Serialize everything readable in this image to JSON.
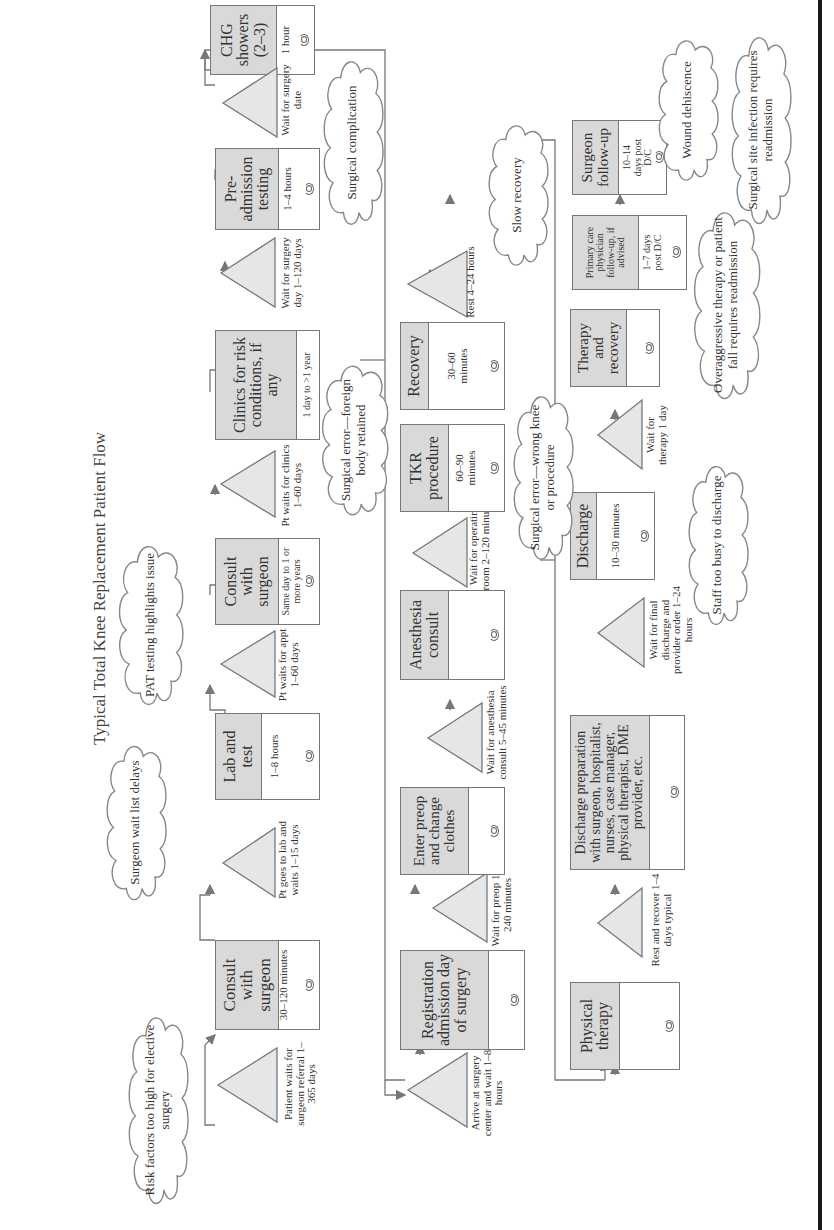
{
  "title": "Typical Total Knee Replacement Patient Flow",
  "colors": {
    "box_header": "#d9d9d9",
    "line": "#777777",
    "border": "#1a1a1a"
  },
  "process_boxes": [
    {
      "id": "consult1",
      "title": "Consult with surgeon",
      "detail": "30–120 minutes",
      "icon": "cycle-icon"
    },
    {
      "id": "lab",
      "title": "Lab and test",
      "detail": "1–8 hours",
      "icon": "cycle-icon"
    },
    {
      "id": "consult2",
      "title": "Consult with surgeon",
      "detail": "Same day to 1 or more years",
      "icon": "cycle-icon"
    },
    {
      "id": "clinics",
      "title": "Clinics for risk conditions, if any",
      "detail": "1 day to >1 year",
      "icon": ""
    },
    {
      "id": "preadmission",
      "title": "Pre-admission testing",
      "detail": "1–4 hours",
      "icon": "cycle-icon"
    },
    {
      "id": "chg",
      "title": "CHG showers (2–3)",
      "detail": "1 hour",
      "icon": "cycle-icon"
    },
    {
      "id": "registration",
      "title": "Registration admission day of surgery",
      "detail": "",
      "icon": "cycle-icon"
    },
    {
      "id": "preop",
      "title": "Enter preop and change clothes",
      "detail": "",
      "icon": "cycle-icon"
    },
    {
      "id": "anesthesia",
      "title": "Anesthesia consult",
      "detail": "",
      "icon": "cycle-icon"
    },
    {
      "id": "tkr",
      "title": "TKR procedure",
      "detail": "60–90 minutes",
      "icon": "cycle-icon"
    },
    {
      "id": "recovery",
      "title": "Recovery",
      "detail": "30–60 minutes",
      "icon": "cycle-icon"
    },
    {
      "id": "pt",
      "title": "Physical therapy",
      "detail": "",
      "icon": "cycle-icon"
    },
    {
      "id": "dischargeprep",
      "title": "Discharge preparation with surgeon, hospitalist, nurses, case manager, physical therapist, DME provider, etc.",
      "detail": "",
      "icon": "cycle-icon"
    },
    {
      "id": "discharge",
      "title": "Discharge",
      "detail": "10–30 minutes",
      "icon": "cycle-icon"
    },
    {
      "id": "therapy",
      "title": "Therapy and recovery",
      "detail": "",
      "icon": "cycle-icon"
    },
    {
      "id": "pcp",
      "title": "Primary care physician follow-up, if advised",
      "detail": "1–7 days post D/C",
      "icon": "cycle-icon"
    },
    {
      "id": "surgeonfu",
      "title": "Surgeon follow-up",
      "detail": "10–14 days post D/C",
      "icon": "cycle-icon"
    }
  ],
  "waits": [
    {
      "id": "w1",
      "label": "Patient waits for surgeon referral 1–365 days"
    },
    {
      "id": "w2",
      "label": "Pt goes to lab and waits 1–15 days"
    },
    {
      "id": "w3",
      "label": "Pt waits for appt 1–60 days"
    },
    {
      "id": "w4",
      "label": "Pt waits for clinics 1–60 days"
    },
    {
      "id": "w5",
      "label": "Wait for surgery day 1–120 days"
    },
    {
      "id": "w6",
      "label": "Wait for surgery date"
    },
    {
      "id": "w7",
      "label": "Arrive at surgery center and wait 1–8 hours"
    },
    {
      "id": "w8",
      "label": "Wait for preop 10–240 minutes"
    },
    {
      "id": "w9",
      "label": "Wait for anesthesia consult 5–45 minutes"
    },
    {
      "id": "w10",
      "label": "Wait for operating room 2–120 minutes"
    },
    {
      "id": "w11",
      "label": "Rest 4–24 hours"
    },
    {
      "id": "w12",
      "label": "Rest and recover 1–4 days typical"
    },
    {
      "id": "w13",
      "label": "Wait for final discharge and provider order 1–24 hours"
    },
    {
      "id": "w14",
      "label": "Wait for therapy 1 day"
    }
  ],
  "issues": [
    {
      "id": "c1",
      "label": "Risk factors too high for elective surgery"
    },
    {
      "id": "c2",
      "label": "Surgeon wait list delays"
    },
    {
      "id": "c3",
      "label": "PAT testing highlights issue"
    },
    {
      "id": "c4",
      "label": "Surgical error—foreign body retained"
    },
    {
      "id": "c5",
      "label": "Surgical complication"
    },
    {
      "id": "c6",
      "label": "Surgical error—wrong knee or procedure"
    },
    {
      "id": "c7",
      "label": "Slow recovery"
    },
    {
      "id": "c8",
      "label": "Staff too busy to discharge"
    },
    {
      "id": "c9",
      "label": "Overaggressive therapy or patient fall requires readmission"
    },
    {
      "id": "c10",
      "label": "Wound dehiscence"
    },
    {
      "id": "c11",
      "label": "Surgical site infection requires readmission"
    }
  ]
}
